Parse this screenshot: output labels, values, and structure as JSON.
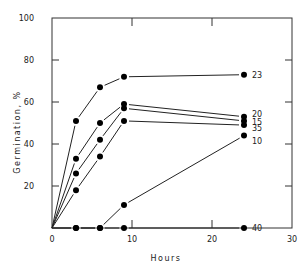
{
  "chart_data": {
    "type": "line",
    "title": "",
    "xlabel": "Hours",
    "ylabel": "Germination, %",
    "xlim": [
      0,
      30
    ],
    "ylim": [
      0,
      100
    ],
    "xticks": [
      0,
      10,
      20,
      30
    ],
    "yticks": [
      20,
      40,
      60,
      80,
      100
    ],
    "grid": false,
    "legend_position": "inline-right",
    "series": [
      {
        "name": "23",
        "x": [
          0,
          3,
          6,
          9,
          24
        ],
        "values": [
          0,
          51,
          67,
          72,
          73
        ]
      },
      {
        "name": "20",
        "x": [
          0,
          3,
          6,
          9,
          24
        ],
        "values": [
          0,
          33,
          50,
          59,
          53
        ]
      },
      {
        "name": "15",
        "x": [
          0,
          3,
          6,
          9,
          24
        ],
        "values": [
          0,
          26,
          42,
          57,
          51
        ]
      },
      {
        "name": "35",
        "x": [
          0,
          3,
          6,
          9,
          24
        ],
        "values": [
          0,
          18,
          34,
          51,
          49
        ]
      },
      {
        "name": "10",
        "x": [
          0,
          3,
          6,
          9,
          24
        ],
        "values": [
          0,
          0,
          0,
          11,
          44
        ]
      },
      {
        "name": "40",
        "x": [
          0,
          3,
          6,
          9,
          24
        ],
        "values": [
          0,
          0,
          0,
          0,
          0
        ]
      }
    ]
  },
  "labels": {
    "xlabel": "Hours",
    "ylabel": "Germination, %"
  }
}
